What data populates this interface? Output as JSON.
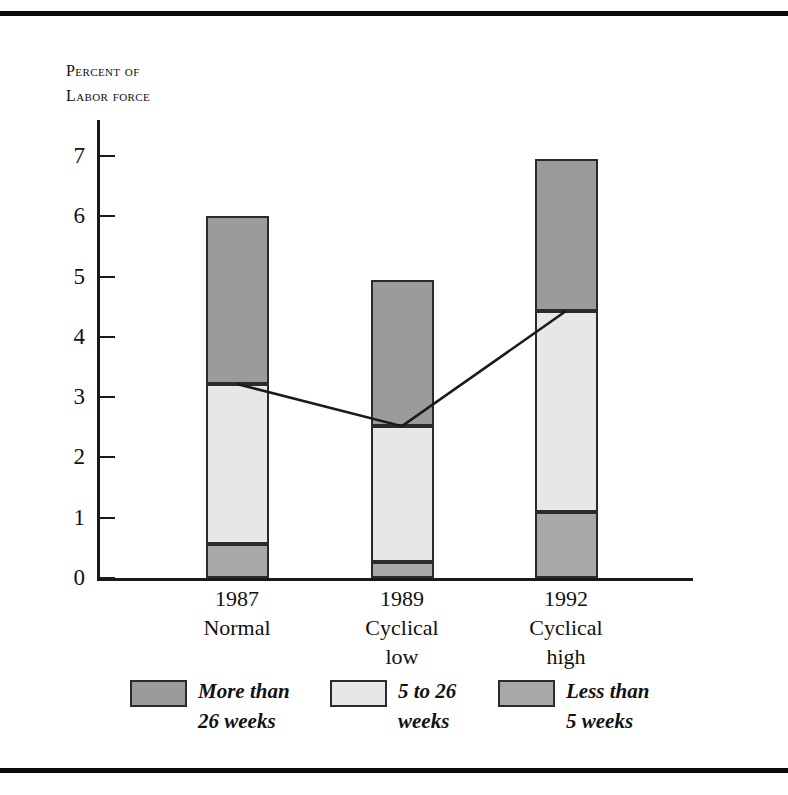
{
  "figure": {
    "axis_title_line1": "Percent of",
    "axis_title_line2": "Labor force"
  },
  "colors": {
    "more_than_26_weeks": "#9b9b9b",
    "five_to_26_weeks": "#e7e7e7",
    "less_than_5_weeks": "#a8a8a8",
    "outline": "#2b2b2b",
    "axis": "#1a1a1a",
    "rule": "#0b0b0b",
    "background": "#ffffff"
  },
  "legend": [
    {
      "label_line1": "More than",
      "label_line2": "26 weeks",
      "series": "More than 26 weeks",
      "color": "#9b9b9b"
    },
    {
      "label_line1": "5 to 26",
      "label_line2": "weeks",
      "series": "5 to 26 weeks",
      "color": "#e7e7e7"
    },
    {
      "label_line1": "Less than",
      "label_line2": "5 weeks",
      "series": "Less than 5 weeks",
      "color": "#a8a8a8"
    }
  ],
  "chart_data": {
    "type": "bar",
    "stacked": true,
    "title": "",
    "subtitle": "",
    "xlabel": "",
    "ylabel": "Percent of labor force",
    "ylim": [
      0,
      7.6
    ],
    "yticks": [
      0,
      1,
      2,
      3,
      4,
      5,
      6,
      7
    ],
    "ytick_labels": [
      "0",
      "1",
      "2",
      "3",
      "4",
      "5",
      "6",
      "7"
    ],
    "grid": false,
    "legend_position": "bottom",
    "categories": [
      "1987",
      "1989",
      "1992"
    ],
    "category_sublabels": [
      "Normal",
      "Cyclical low",
      "Cyclical high"
    ],
    "category_sublabel_lines": [
      [
        "Normal",
        ""
      ],
      [
        "Cyclical",
        "low"
      ],
      [
        "Cyclical",
        "high"
      ]
    ],
    "series": [
      {
        "name": "Less than 5 weeks",
        "values": [
          0.56,
          0.27,
          1.1
        ],
        "color": "#a8a8a8"
      },
      {
        "name": "5 to 26 weeks",
        "values": [
          2.66,
          2.25,
          3.33
        ],
        "color": "#e7e7e7"
      },
      {
        "name": "More than 26 weeks",
        "values": [
          2.78,
          2.43,
          2.52
        ],
        "color": "#9b9b9b"
      }
    ],
    "totals": [
      6.0,
      4.95,
      6.95
    ],
    "cumulative_tops": {
      "less_than_5_weeks": [
        0.56,
        0.27,
        1.1
      ],
      "through_5_to_26_weeks": [
        3.22,
        2.52,
        4.43
      ],
      "total": [
        6.0,
        4.95,
        6.95
      ]
    },
    "overlay_line": {
      "name": "Unemployed 26 weeks or less",
      "values": [
        3.22,
        2.52,
        4.43
      ],
      "color": "#1a1a1a",
      "connects": "top of 5 to 26 weeks segment"
    }
  }
}
